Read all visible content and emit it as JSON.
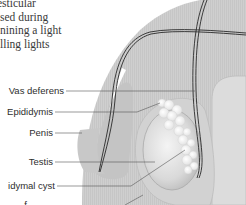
{
  "intro_text_lines": [
    "esticular",
    "sed during",
    "nining a light",
    "lling lights"
  ],
  "labels": [
    {
      "id": "vas-deferens",
      "text": "Vas deferens"
    },
    {
      "id": "epididymis",
      "text": "Epididymis"
    },
    {
      "id": "penis",
      "text": "Penis"
    },
    {
      "id": "testis",
      "text": "Testis"
    },
    {
      "id": "epididymal-cyst",
      "text": "idymal cyst"
    },
    {
      "id": "scrotum",
      "text": "f"
    }
  ],
  "colors": {
    "body_fill": "#c9c9c9",
    "scrotum_fill": "#d4d4d4",
    "testis_fill": "#e0e0e0",
    "cyst_fill": "#f6f6f6",
    "tube_stroke": "#2a2a2a",
    "leader_stroke": "#555555",
    "text": "#2e2e2e"
  }
}
